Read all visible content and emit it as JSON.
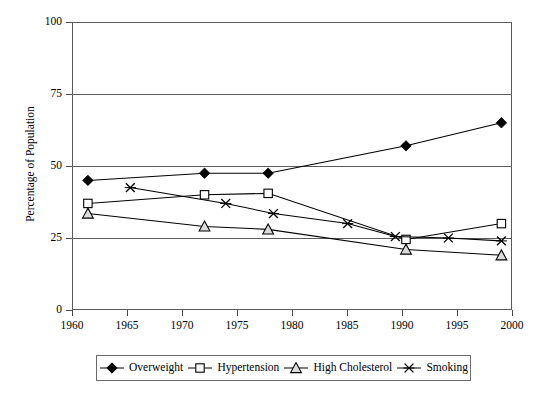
{
  "chart_data": {
    "type": "line",
    "title": "",
    "subtitle": "",
    "xlabel": "",
    "ylabel": "Percentage of Population",
    "xlim": [
      1960,
      2001.5
    ],
    "ylim": [
      0,
      100
    ],
    "yticks": [
      0,
      25,
      50,
      75,
      100
    ],
    "xticks": [
      1960,
      1965,
      1970,
      1975,
      1980,
      1985,
      1990,
      1995,
      2000
    ],
    "grid": "horizontal",
    "legend_position": "bottom",
    "series": [
      {
        "name": "Overweight",
        "marker": "filled-diamond",
        "color": "#000000",
        "points": [
          {
            "x": 1961.5,
            "y": 45
          },
          {
            "x": 1972.5,
            "y": 47.5
          },
          {
            "x": 1978.5,
            "y": 47.5
          },
          {
            "x": 1991.5,
            "y": 57
          },
          {
            "x": 2000.5,
            "y": 65
          }
        ]
      },
      {
        "name": "Hypertension",
        "marker": "open-square",
        "color": "#000000",
        "points": [
          {
            "x": 1961.5,
            "y": 37
          },
          {
            "x": 1972.5,
            "y": 40
          },
          {
            "x": 1978.5,
            "y": 40.5
          },
          {
            "x": 1991.5,
            "y": 24.5
          },
          {
            "x": 2000.5,
            "y": 30
          }
        ]
      },
      {
        "name": "High Cholesterol",
        "marker": "open-triangle",
        "color": "#000000",
        "points": [
          {
            "x": 1961.5,
            "y": 33.5
          },
          {
            "x": 1972.5,
            "y": 29
          },
          {
            "x": 1978.5,
            "y": 28
          },
          {
            "x": 1991.5,
            "y": 21
          },
          {
            "x": 2000.5,
            "y": 19
          }
        ]
      },
      {
        "name": "Smoking",
        "marker": "cross-x",
        "color": "#000000",
        "points": [
          {
            "x": 1965.5,
            "y": 42.5
          },
          {
            "x": 1974.5,
            "y": 37
          },
          {
            "x": 1979.0,
            "y": 33.5
          },
          {
            "x": 1986.0,
            "y": 30
          },
          {
            "x": 1990.5,
            "y": 25.5
          },
          {
            "x": 1995.5,
            "y": 25
          },
          {
            "x": 2000.5,
            "y": 24
          }
        ]
      }
    ]
  },
  "axes": {
    "ytick_labels": [
      "100",
      "75",
      "50",
      "25",
      "0"
    ],
    "xtick_labels": [
      "1960",
      "1965",
      "1970",
      "1975",
      "1980",
      "1985",
      "1990",
      "1995",
      "2000"
    ],
    "ylabel": "Percentage of Population"
  },
  "legend": {
    "items": [
      {
        "label": "Overweight",
        "marker": "filled-diamond"
      },
      {
        "label": "Hypertension",
        "marker": "open-square"
      },
      {
        "label": "High Cholesterol",
        "marker": "open-triangle"
      },
      {
        "label": "Smoking",
        "marker": "cross-x"
      }
    ]
  },
  "colors": {
    "ink": "#000000",
    "frame": "#5b5b5b",
    "background": "#ffffff"
  }
}
